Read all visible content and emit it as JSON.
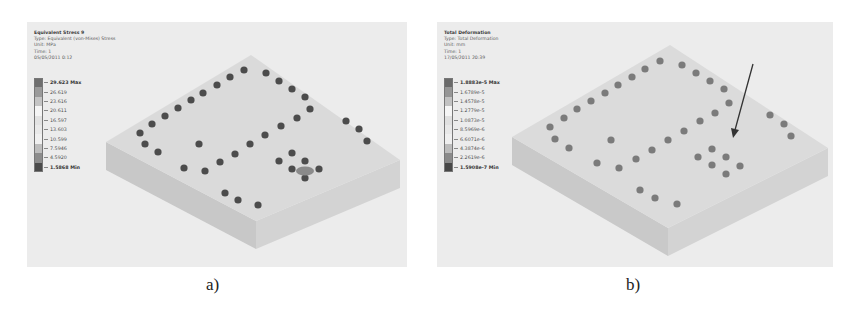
{
  "figure": {
    "panels": [
      {
        "id": "a",
        "caption": "a)",
        "info": {
          "title": "Equivalent Stress 9",
          "type": "Type: Equivalent (von-Mises) Stress",
          "unit": "Unit: MPa",
          "time": "Time: 1",
          "timestamp": "05/05/2011 0:12"
        },
        "legend": [
          {
            "label": "29.623 Max",
            "color": "#6e6e6e",
            "bold": true
          },
          {
            "label": "26.619",
            "color": "#9a9a9a",
            "bold": false
          },
          {
            "label": "23.616",
            "color": "#c4c4c4",
            "bold": false
          },
          {
            "label": "20.611",
            "color": "#f4f4f4",
            "bold": false
          },
          {
            "label": "16.597",
            "color": "#e2e2e2",
            "bold": false
          },
          {
            "label": "13.603",
            "color": "#e9e9e9",
            "bold": false
          },
          {
            "label": "10.599",
            "color": "#f0f0f0",
            "bold": false
          },
          {
            "label": "7.5946",
            "color": "#bdbdbd",
            "bold": false
          },
          {
            "label": "4.5920",
            "color": "#8c8c8c",
            "bold": false
          },
          {
            "label": "1.5868 Min",
            "color": "#4a4a4a",
            "bold": true
          }
        ]
      },
      {
        "id": "b",
        "caption": "b)",
        "info": {
          "title": "Total Deformation",
          "type": "Type: Total Deformation",
          "unit": "Unit: mm",
          "time": "Time: 1",
          "timestamp": "17/05/2011 20:39"
        },
        "legend": [
          {
            "label": "1.8883e-5 Max",
            "color": "#6a6a6a",
            "bold": true
          },
          {
            "label": "1.6789e-5",
            "color": "#969696",
            "bold": false
          },
          {
            "label": "1.4578e-5",
            "color": "#c2c2c2",
            "bold": false
          },
          {
            "label": "1.2779e-5",
            "color": "#f5f5f5",
            "bold": false
          },
          {
            "label": "1.0873e-5",
            "color": "#e0e0e0",
            "bold": false
          },
          {
            "label": "8.5969e-6",
            "color": "#e8e8e8",
            "bold": false
          },
          {
            "label": "6.6071e-6",
            "color": "#efefef",
            "bold": false
          },
          {
            "label": "4.3874e-6",
            "color": "#bcbcbc",
            "bold": false
          },
          {
            "label": "2.2619e-6",
            "color": "#8a8a8a",
            "bold": false
          },
          {
            "label": "1.5908e-7 Min",
            "color": "#474747",
            "bold": true
          }
        ]
      }
    ],
    "colors": {
      "panel_bg": "#ececec",
      "plate_top": "#d9d9d9",
      "plate_side_left": "#c9c9c9",
      "plate_side_right": "#d2d2d2",
      "bolt_a": "#4d4d4d",
      "bolt_b": "#7a7a7a",
      "arrow": "#333333"
    }
  }
}
